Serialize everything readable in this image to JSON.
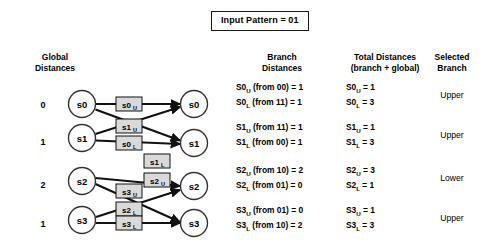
{
  "input_pattern": {
    "label": "Input Pattern = 01"
  },
  "left": {
    "header_line1": "Global",
    "header_line2": "Distances",
    "global_distances": [
      "0",
      "1",
      "2",
      "1"
    ],
    "states_left": [
      "s0",
      "s1",
      "s2",
      "s3"
    ],
    "states_right": [
      "s0",
      "s1",
      "s2",
      "s3"
    ],
    "branch_labels": [
      {
        "text": "s0",
        "sub": "U"
      },
      {
        "text": "s1",
        "sub": "U"
      },
      {
        "text": "s0",
        "sub": "L"
      },
      {
        "text": "s1",
        "sub": "L"
      },
      {
        "text": "s2",
        "sub": "U"
      },
      {
        "text": "s3",
        "sub": "U"
      },
      {
        "text": "s2",
        "sub": "L"
      },
      {
        "text": "s3",
        "sub": "L"
      }
    ]
  },
  "table": {
    "headers": {
      "branch_distances_l1": "Branch",
      "branch_distances_l2": "Distances",
      "total_distances_l1": "Total Distances",
      "total_distances_l2": "(branch + global)",
      "selected_branch_l1": "Selected",
      "selected_branch_l2": "Branch"
    },
    "rows": [
      {
        "branch_upper_name": "S0",
        "branch_upper_sub": "U",
        "branch_upper_rest": " (from 00) = 1",
        "branch_lower_name": "S0",
        "branch_lower_sub": "L",
        "branch_lower_rest": " (from 11) = 1",
        "total_upper_name": "S0",
        "total_upper_sub": "U",
        "total_upper_rest": " = 1",
        "total_lower_name": "S0",
        "total_lower_sub": "L",
        "total_lower_rest": " = 3",
        "selected": "Upper"
      },
      {
        "branch_upper_name": "S1",
        "branch_upper_sub": "U",
        "branch_upper_rest": " (from 11) = 1",
        "branch_lower_name": "S1",
        "branch_lower_sub": "L",
        "branch_lower_rest": " (from 00) = 1",
        "total_upper_name": "S1",
        "total_upper_sub": "U",
        "total_upper_rest": " = 1",
        "total_lower_name": "S1",
        "total_lower_sub": "L",
        "total_lower_rest": " = 3",
        "selected": "Upper"
      },
      {
        "branch_upper_name": "S2",
        "branch_upper_sub": "U",
        "branch_upper_rest": " (from 10) = 2",
        "branch_lower_name": "S2",
        "branch_lower_sub": "L",
        "branch_lower_rest": " (from 01) = 0",
        "total_upper_name": "S2",
        "total_upper_sub": "U",
        "total_upper_rest": " = 3",
        "total_lower_name": "S2",
        "total_lower_sub": "L",
        "total_lower_rest": " = 1",
        "selected": "Lower"
      },
      {
        "branch_upper_name": "S3",
        "branch_upper_sub": "U",
        "branch_upper_rest": " (from 01) = 0",
        "branch_lower_name": "S3",
        "branch_lower_sub": "L",
        "branch_lower_rest": " (from 10) = 2",
        "total_upper_name": "S3",
        "total_upper_sub": "U",
        "total_upper_rest": " = 1",
        "total_lower_name": "S3",
        "total_lower_sub": "L",
        "total_lower_rest": " = 3",
        "selected": "Upper"
      }
    ]
  },
  "colors": {
    "line": "#111111",
    "node_stroke": "#333333",
    "label_fill": "#d9d9d9",
    "label_stroke": "#111111",
    "text": "#000000"
  }
}
